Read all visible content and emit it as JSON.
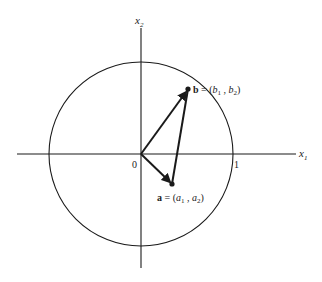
{
  "axes": {
    "x_label": "x",
    "x_sub": "1",
    "y_label": "x",
    "y_sub": "2",
    "origin_label": "0",
    "unit_label": "1"
  },
  "points": {
    "b": {
      "name": "b",
      "eq": " = (",
      "c1": "b",
      "c1_sub": "1",
      "sep": " , ",
      "c2": "b",
      "c2_sub": "2",
      "close": ")"
    },
    "a": {
      "name": "a",
      "eq": " = (",
      "c1": "a",
      "c1_sub": "1",
      "sep": " , ",
      "c2": "a",
      "c2_sub": "2",
      "close": ")"
    }
  },
  "colors": {
    "stroke": "#1a1a1a",
    "text": "#222222"
  }
}
